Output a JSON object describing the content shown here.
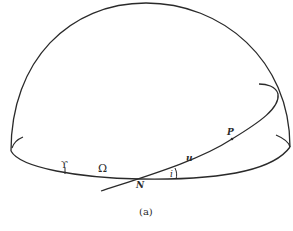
{
  "diagram": {
    "caption": "(a)",
    "labels": {
      "aries": "ϒ",
      "node_longitude": "Ω",
      "node": "N",
      "inclination": "i",
      "argument_of_latitude": "u",
      "point": "P"
    },
    "stroke_color": "#2a2a2a",
    "background": "#ffffff"
  }
}
